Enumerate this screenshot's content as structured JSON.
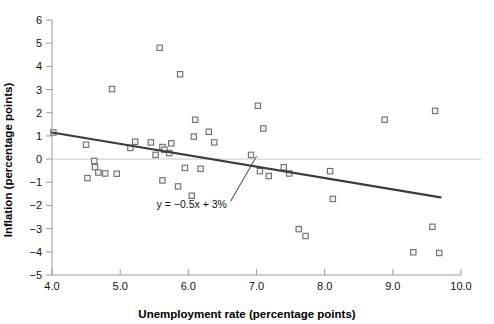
{
  "chart_data": {
    "type": "scatter",
    "title": "",
    "xlabel": "Unemployment rate (percentage points)",
    "ylabel": "Inflation (percentage points)",
    "xlim": [
      4.0,
      10.0
    ],
    "ylim": [
      -5,
      6
    ],
    "xticks": [
      "4.0",
      "5.0",
      "6.0",
      "7.0",
      "8.0",
      "9.0",
      "10.0"
    ],
    "xtick_values": [
      4.0,
      5.0,
      6.0,
      7.0,
      8.0,
      9.0,
      10.0
    ],
    "yticks": [
      "6",
      "5",
      "4",
      "3",
      "2",
      "1",
      "0",
      "-1",
      "-2",
      "-3",
      "-4",
      "-5"
    ],
    "ytick_values": [
      6,
      5,
      4,
      3,
      2,
      1,
      0,
      -1,
      -2,
      -3,
      -4,
      -5
    ],
    "grid": false,
    "legend": "none",
    "zero_line": true,
    "marker": "open-square",
    "marker_color": "#6f6f6f",
    "marker_fill": "#f2f2f2",
    "line_color": "#3b3b3b",
    "axis_color": "#9a9a9a",
    "points": [
      {
        "x": 4.02,
        "y": 1.15
      },
      {
        "x": 4.5,
        "y": 0.62
      },
      {
        "x": 4.62,
        "y": -0.08
      },
      {
        "x": 4.52,
        "y": -0.82
      },
      {
        "x": 4.63,
        "y": -0.35
      },
      {
        "x": 4.68,
        "y": -0.58
      },
      {
        "x": 4.78,
        "y": -0.62
      },
      {
        "x": 4.88,
        "y": 3.02
      },
      {
        "x": 4.95,
        "y": -0.63
      },
      {
        "x": 5.15,
        "y": 0.48
      },
      {
        "x": 5.22,
        "y": 0.75
      },
      {
        "x": 5.45,
        "y": 0.72
      },
      {
        "x": 5.58,
        "y": 4.8
      },
      {
        "x": 5.52,
        "y": 0.18
      },
      {
        "x": 5.62,
        "y": 0.52
      },
      {
        "x": 5.65,
        "y": 0.4
      },
      {
        "x": 5.72,
        "y": 0.26
      },
      {
        "x": 5.75,
        "y": 0.68
      },
      {
        "x": 5.88,
        "y": 3.66
      },
      {
        "x": 5.62,
        "y": -0.92
      },
      {
        "x": 5.85,
        "y": -1.18
      },
      {
        "x": 5.95,
        "y": -0.38
      },
      {
        "x": 6.1,
        "y": 1.7
      },
      {
        "x": 6.08,
        "y": 0.97
      },
      {
        "x": 6.05,
        "y": -1.58
      },
      {
        "x": 6.3,
        "y": 1.18
      },
      {
        "x": 6.38,
        "y": 0.72
      },
      {
        "x": 6.18,
        "y": -0.42
      },
      {
        "x": 7.02,
        "y": 2.3
      },
      {
        "x": 6.92,
        "y": 0.18
      },
      {
        "x": 7.1,
        "y": 1.32
      },
      {
        "x": 7.05,
        "y": -0.52
      },
      {
        "x": 7.18,
        "y": -0.73
      },
      {
        "x": 7.4,
        "y": -0.35
      },
      {
        "x": 7.48,
        "y": -0.62
      },
      {
        "x": 7.62,
        "y": -3.02
      },
      {
        "x": 7.72,
        "y": -3.32
      },
      {
        "x": 8.08,
        "y": -0.52
      },
      {
        "x": 8.12,
        "y": -1.72
      },
      {
        "x": 8.88,
        "y": 1.7
      },
      {
        "x": 9.3,
        "y": -4.02
      },
      {
        "x": 9.62,
        "y": 2.08
      },
      {
        "x": 9.58,
        "y": -2.92
      },
      {
        "x": 9.68,
        "y": -4.05
      }
    ],
    "trendline": {
      "equation": "y = −0.5x + 3%",
      "slope": -0.5,
      "intercept": 3,
      "x_start": 4.0,
      "x_end": 9.7,
      "y_start": 1.15,
      "y_end": -1.65
    },
    "annotation": {
      "text": "y = −0.5x + 3%",
      "x": 6.05,
      "y": -2.1,
      "leader_from_x": 6.62,
      "leader_from_y": -1.82,
      "leader_to_x": 7.0,
      "leader_to_y": 0.12
    }
  }
}
